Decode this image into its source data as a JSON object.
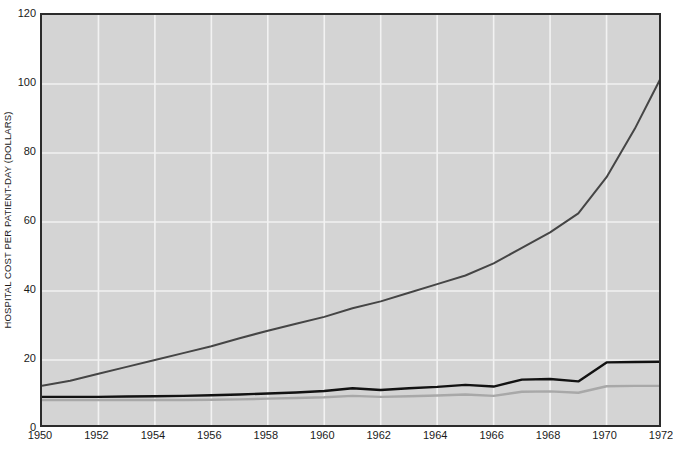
{
  "chart_data": {
    "type": "line",
    "title": "",
    "xlabel": "",
    "ylabel": "HOSPITAL COST PER PATIENT-DAY (DOLLARS)",
    "xlim": [
      1950,
      1972
    ],
    "ylim": [
      0,
      120
    ],
    "grid": true,
    "legend": "none",
    "background_color": "#d4d4d4",
    "gridline_color": "#f2f2f2",
    "axis_color": "#2b2b2b",
    "x": [
      1950,
      1951,
      1952,
      1953,
      1954,
      1955,
      1956,
      1957,
      1958,
      1959,
      1960,
      1961,
      1962,
      1963,
      1964,
      1965,
      1966,
      1967,
      1968,
      1969,
      1970,
      1971,
      1972
    ],
    "x_tick_labels": [
      "1950",
      "1952",
      "1954",
      "1956",
      "1958",
      "1960",
      "1962",
      "1964",
      "1966",
      "1968",
      "1970",
      "1972"
    ],
    "x_tick_values": [
      1950,
      1952,
      1954,
      1956,
      1958,
      1960,
      1962,
      1964,
      1966,
      1968,
      1970,
      1972
    ],
    "y_tick_labels": [
      "0",
      "20",
      "40",
      "60",
      "80",
      "100",
      "120"
    ],
    "y_tick_values": [
      0,
      20,
      40,
      60,
      80,
      100,
      120
    ],
    "series": [
      {
        "name": "hospital-cost-per-patient-day",
        "color": "#454545",
        "width": 2.0,
        "values": [
          12.5,
          14.0,
          16.0,
          18.0,
          20.0,
          22.0,
          24.0,
          26.3,
          28.5,
          30.5,
          32.5,
          35.0,
          37.0,
          39.5,
          42.0,
          44.5,
          48.0,
          52.5,
          57.0,
          62.5,
          73.0,
          87.0,
          103.0
        ]
      },
      {
        "name": "black-flat-series",
        "color": "#121212",
        "width": 2.4,
        "values": [
          9.3,
          9.3,
          9.3,
          9.4,
          9.5,
          9.6,
          9.8,
          10.0,
          10.3,
          10.6,
          11.0,
          11.8,
          11.3,
          11.8,
          12.2,
          12.8,
          12.3,
          14.3,
          14.5,
          13.8,
          19.3,
          19.4,
          19.5
        ]
      },
      {
        "name": "gray-flat-series",
        "color": "#a8a8a8",
        "width": 2.4,
        "values": [
          8.4,
          8.4,
          8.4,
          8.4,
          8.4,
          8.4,
          8.5,
          8.6,
          8.8,
          9.0,
          9.2,
          9.6,
          9.3,
          9.5,
          9.7,
          10.0,
          9.6,
          10.8,
          10.9,
          10.5,
          12.4,
          12.5,
          12.5
        ]
      }
    ]
  }
}
